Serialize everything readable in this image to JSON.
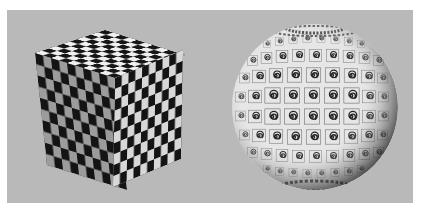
{
  "scene": {
    "background_color": "#ffffff",
    "panel_color": "#b9b9b9",
    "objects": [
      {
        "name": "checkered-cube",
        "texture": "checkerboard",
        "grid_per_face": 10,
        "colors": {
          "dark": "#141414",
          "light_top": "#f2f2f2",
          "light_left": "#9a9a9a",
          "light_right": "#d6d6d6"
        }
      },
      {
        "name": "spiral-textured-sphere",
        "texture": "spiral-tiles",
        "tile_glyph": "spiral",
        "colors": {
          "base": "#e8e8e8",
          "grid_line": "#6a6a6a",
          "glyph": "#2a2a2a",
          "shadow": "#3a3a3a"
        }
      }
    ]
  }
}
